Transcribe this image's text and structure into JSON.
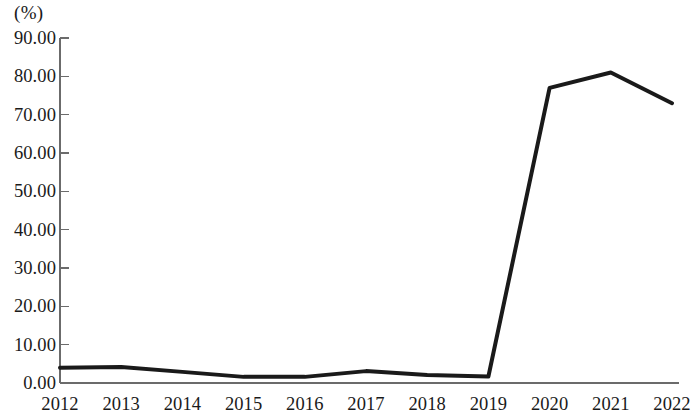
{
  "chart_data": {
    "type": "line",
    "title": "",
    "subtitle": "",
    "xlabel": "",
    "ylabel": "",
    "unit_label": "(%)",
    "categories": [
      "2012",
      "2013",
      "2014",
      "2015",
      "2016",
      "2017",
      "2018",
      "2019",
      "2020",
      "2021",
      "2022"
    ],
    "x": [
      2012,
      2013,
      2014,
      2015,
      2016,
      2017,
      2018,
      2019,
      2020,
      2021,
      2022
    ],
    "values": [
      4.0,
      4.2,
      2.9,
      1.6,
      1.6,
      3.1,
      2.1,
      1.7,
      77.0,
      81.0,
      73.0
    ],
    "series": [
      {
        "name": "",
        "values": [
          4.0,
          4.2,
          2.9,
          1.6,
          1.6,
          3.1,
          2.1,
          1.7,
          77.0,
          81.0,
          73.0
        ]
      }
    ],
    "ylim": [
      0,
      90
    ],
    "xlim": [
      2012,
      2022
    ],
    "y_ticks": [
      0,
      10,
      20,
      30,
      40,
      50,
      60,
      70,
      80,
      90
    ],
    "y_tick_labels": [
      "0.00",
      "10.00",
      "20.00",
      "30.00",
      "40.00",
      "50.00",
      "60.00",
      "70.00",
      "80.00",
      "90.00"
    ],
    "grid": false,
    "legend": "none",
    "line_color": "#1a1a1a",
    "line_width": 4,
    "axis_color": "#6b6b6b",
    "background_color": "#ffffff",
    "markers": false,
    "annotations": []
  },
  "axis": {
    "unit_label": "(%)",
    "y_tick_labels": [
      "90.00",
      "80.00",
      "70.00",
      "60.00",
      "50.00",
      "40.00",
      "30.00",
      "20.00",
      "10.00",
      "0.00"
    ],
    "x_tick_labels": [
      "2012",
      "2013",
      "2014",
      "2015",
      "2016",
      "2017",
      "2018",
      "2019",
      "2020",
      "2021",
      "2022"
    ]
  }
}
